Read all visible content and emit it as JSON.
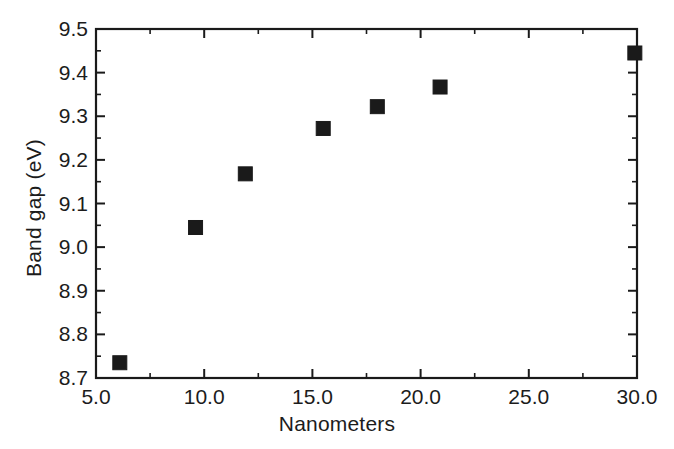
{
  "chart_data": {
    "type": "scatter",
    "title": "",
    "xlabel": "Nanometers",
    "ylabel": "Band gap (eV)",
    "xlim": [
      5.0,
      30.0
    ],
    "ylim": [
      8.7,
      9.5
    ],
    "grid": false,
    "legend": null,
    "marker": {
      "shape": "square",
      "color": "#1a1a1a",
      "size_px": 14
    },
    "x_ticks": [
      5.0,
      10.0,
      15.0,
      20.0,
      25.0,
      30.0
    ],
    "x_tick_labels": [
      "5.0",
      "10.0",
      "15.0",
      "20.0",
      "25.0",
      "30.0"
    ],
    "x_minor_tick_interval": 2.5,
    "y_ticks": [
      8.7,
      8.8,
      8.9,
      9.0,
      9.1,
      9.2,
      9.3,
      9.4,
      9.5
    ],
    "y_tick_labels": [
      "8.7",
      "8.8",
      "8.9",
      "9.0",
      "9.1",
      "9.2",
      "9.3",
      "9.4",
      "9.5"
    ],
    "y_minor_tick_interval": 0.05,
    "series": [
      {
        "name": "Band gap vs size",
        "points": [
          {
            "x": 6.1,
            "y": 8.735
          },
          {
            "x": 9.6,
            "y": 9.045
          },
          {
            "x": 11.9,
            "y": 9.168
          },
          {
            "x": 15.5,
            "y": 9.272
          },
          {
            "x": 18.0,
            "y": 9.322
          },
          {
            "x": 20.9,
            "y": 9.367
          },
          {
            "x": 29.9,
            "y": 9.445
          }
        ]
      }
    ]
  },
  "figure": {
    "background_color": "#ffffff",
    "axis_color": "#1a1a1a",
    "frame": {
      "left": 96,
      "right": 637,
      "top": 29,
      "bottom": 378
    }
  }
}
